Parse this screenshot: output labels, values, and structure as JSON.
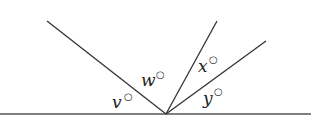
{
  "diagram": {
    "type": "angles-on-a-straight-line",
    "colors": {
      "stroke": "#333333",
      "text": "#222222",
      "background": "#ffffff"
    },
    "vertex": {
      "x": 166,
      "y": 114
    },
    "baseline": {
      "x1": 0,
      "y1": 114,
      "x2": 311,
      "y2": 114
    },
    "rays": [
      {
        "name": "left-ray",
        "x2": 47,
        "y2": 21
      },
      {
        "name": "middle-ray",
        "x2": 217,
        "y2": 21
      },
      {
        "name": "right-ray",
        "x2": 266,
        "y2": 41
      }
    ],
    "labels": [
      {
        "name": "angle-v",
        "text": "v",
        "degree": "○",
        "x": 112,
        "y": 108
      },
      {
        "name": "angle-w",
        "text": "w",
        "degree": "○",
        "x": 141,
        "y": 86
      },
      {
        "name": "angle-x",
        "text": "x",
        "degree": "○",
        "x": 198,
        "y": 72
      },
      {
        "name": "angle-y",
        "text": "y",
        "degree": "○",
        "x": 203,
        "y": 104
      }
    ]
  }
}
